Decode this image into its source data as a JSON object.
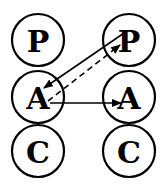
{
  "diagram": {
    "columns": [
      {
        "id": "left",
        "nodes": [
          {
            "label": "P",
            "cx": 38,
            "cy": 40
          },
          {
            "label": "A",
            "cx": 38,
            "cy": 97
          },
          {
            "label": "C",
            "cx": 38,
            "cy": 151
          }
        ]
      },
      {
        "id": "right",
        "nodes": [
          {
            "label": "P",
            "cx": 129,
            "cy": 40
          },
          {
            "label": "A",
            "cx": 129,
            "cy": 97
          },
          {
            "label": "C",
            "cx": 129,
            "cy": 151
          }
        ]
      }
    ],
    "radius": 26,
    "edges": [
      {
        "from": "right.P",
        "to": "left.A",
        "style": "solid"
      },
      {
        "from": "left.A",
        "to": "right.P",
        "style": "dashed"
      },
      {
        "from": "left.A",
        "to": "right.A",
        "style": "solid"
      }
    ],
    "stroke_color": "#000000"
  }
}
